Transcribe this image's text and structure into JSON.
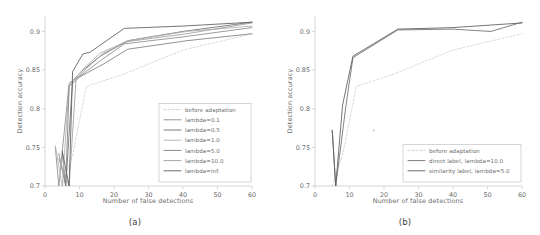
{
  "figure": {
    "panels": [
      {
        "caption": "(a)",
        "xlabel": "Number of false detections",
        "ylabel": "Detection accuracy",
        "xticks": [
          "0",
          "10",
          "20",
          "30",
          "40",
          "50",
          "60"
        ],
        "yticks": [
          "0.7",
          "0.75",
          "0.8",
          "0.85",
          "0.9"
        ],
        "legend": [
          "before adaptation",
          "lambda=0.1",
          "lambda=0.5",
          "lambda=1.0",
          "lambda=5.0",
          "lambda=10.0",
          "lambda=inf."
        ]
      },
      {
        "caption": "(b)",
        "xlabel": "Number of false detections",
        "ylabel": "Detection accuracy",
        "xticks": [
          "0",
          "10",
          "20",
          "30",
          "40",
          "50",
          "60"
        ],
        "yticks": [
          "0.7",
          "0.75",
          "0.8",
          "0.85",
          "0.9"
        ],
        "legend": [
          "before adaptation",
          "direct label, lambda=10.0",
          "similarity label, lambda=5.0"
        ]
      }
    ]
  },
  "chart_data": [
    {
      "type": "line",
      "title": "",
      "xlabel": "Number of false detections",
      "ylabel": "Detection accuracy",
      "xlim": [
        0,
        60
      ],
      "ylim": [
        0.7,
        0.92
      ],
      "grid": false,
      "legend_position": "lower right",
      "panel": "(a)",
      "series": [
        {
          "name": "before adaptation",
          "style": "dashed",
          "color": "#cfcfcf",
          "x": [
            5,
            8,
            12,
            23,
            40,
            60
          ],
          "y": [
            0.7,
            0.74,
            0.829,
            0.845,
            0.876,
            0.897
          ]
        },
        {
          "name": "lambda=0.1",
          "style": "solid",
          "color": "#8a8a8a",
          "x": [
            3,
            4,
            7,
            11,
            16,
            23,
            40,
            60
          ],
          "y": [
            0.75,
            0.7,
            0.833,
            0.845,
            0.862,
            0.884,
            0.893,
            0.905
          ]
        },
        {
          "name": "lambda=0.5",
          "style": "solid",
          "color": "#6e6e6e",
          "x": [
            5,
            6,
            8,
            11,
            16,
            24,
            40,
            60
          ],
          "y": [
            0.743,
            0.7,
            0.836,
            0.85,
            0.868,
            0.888,
            0.9,
            0.912
          ]
        },
        {
          "name": "lambda=1.0",
          "style": "solid",
          "color": "#b0b0b0",
          "x": [
            3,
            5,
            7,
            11,
            16,
            24,
            41,
            60
          ],
          "y": [
            0.752,
            0.7,
            0.83,
            0.851,
            0.872,
            0.888,
            0.9,
            0.907
          ]
        },
        {
          "name": "lambda=5.0",
          "style": "solid",
          "color": "#7d7d7d",
          "x": [
            4,
            6,
            7,
            10,
            17,
            24,
            41,
            60
          ],
          "y": [
            0.742,
            0.7,
            0.829,
            0.841,
            0.858,
            0.877,
            0.888,
            0.897
          ]
        },
        {
          "name": "lambda=10.0",
          "style": "solid",
          "color": "#9d9d9d",
          "x": [
            4,
            7,
            9,
            12,
            17,
            24,
            41,
            60
          ],
          "y": [
            0.735,
            0.7,
            0.838,
            0.852,
            0.872,
            0.887,
            0.897,
            0.911
          ]
        },
        {
          "name": "lambda=inf.",
          "style": "solid",
          "color": "#5c5c5c",
          "x": [
            5,
            7,
            8,
            11,
            13,
            23,
            40,
            60
          ],
          "y": [
            0.745,
            0.7,
            0.848,
            0.871,
            0.873,
            0.904,
            0.907,
            0.912
          ]
        }
      ]
    },
    {
      "type": "line",
      "title": "",
      "xlabel": "Number of false detections",
      "ylabel": "Detection accuracy",
      "xlim": [
        0,
        60
      ],
      "ylim": [
        0.7,
        0.92
      ],
      "grid": false,
      "legend_position": "lower right",
      "panel": "(b)",
      "annotations": [
        {
          "type": "point",
          "x": 17,
          "y": 0.772
        }
      ],
      "series": [
        {
          "name": "before adaptation",
          "style": "dashed",
          "color": "#cfcfcf",
          "x": [
            5,
            8,
            12,
            23,
            40,
            60
          ],
          "y": [
            0.7,
            0.74,
            0.829,
            0.845,
            0.876,
            0.897
          ]
        },
        {
          "name": "direct label, lambda=10.0",
          "style": "solid",
          "color": "#6e6e6e",
          "x": [
            5,
            6,
            9,
            11,
            24,
            40,
            51,
            60
          ],
          "y": [
            0.772,
            0.7,
            0.805,
            0.866,
            0.902,
            0.903,
            0.9,
            0.912
          ]
        },
        {
          "name": "similarity label, lambda=5.0",
          "style": "solid",
          "color": "#5c5c5c",
          "x": [
            5,
            6,
            8,
            11,
            24,
            40,
            60
          ],
          "y": [
            0.772,
            0.7,
            0.805,
            0.868,
            0.903,
            0.905,
            0.911
          ]
        }
      ]
    }
  ]
}
